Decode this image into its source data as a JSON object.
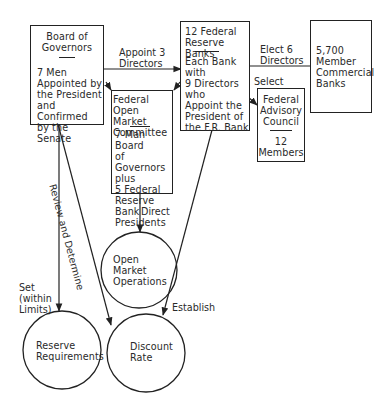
{
  "nodes": {
    "board_of_governors": {
      "title": "Board of\nGovernors",
      "body": "7 Men\nAppointed by\nthe President\nand Confirmed\nby the Senate"
    },
    "federal_reserve_banks": {
      "title": "12 Federal\nReserve Banks",
      "body": "Each Bank\nwith\n9 Directors\nwho\nAppoint the\nPresident of\nthe F.R. Bank"
    },
    "fomc": {
      "title": "Federal\nOpen Market\nCommittee",
      "body": "7-Man Board\nof Governors\nplus\n5 Federal\nReserve Bank\nPresidents"
    },
    "federal_advisory_council": {
      "title": "Federal\nAdvisory\nCouncil",
      "body": "12\nMembers"
    },
    "member_banks": {
      "body": "5,700\nMember\nCommercial\nBanks"
    },
    "open_market_operations": {
      "label": "Open\nMarket\nOperations"
    },
    "reserve_requirements": {
      "label": "Reserve\nRequirements"
    },
    "discount_rate": {
      "label": "Discount\nRate"
    }
  },
  "edges": {
    "appoint_directors": "Appoint 3\nDirectors",
    "elect_directors": "Elect 6\nDirectors",
    "select": "Select",
    "direct": "Direct",
    "review_determine": "Review and Determine",
    "set_within_limits": "Set\n(within\nLimits)",
    "establish": "Establish"
  },
  "colors": {
    "ink": "#222222",
    "background": "#ffffff"
  }
}
